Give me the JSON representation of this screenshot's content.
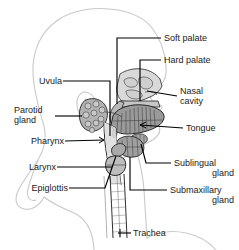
{
  "figure": {
    "background_color": "#ffffff",
    "label_color": "#1a1a1a",
    "leader_color": "#000000",
    "silhouette_color": "#cfcfcf",
    "organ_fill_light": "#d8d8d8",
    "organ_fill_mid": "#b8b8b8",
    "organ_fill_dark": "#8f8f8f"
  },
  "labels": {
    "soft_palate": "Soft palate",
    "hard_palate": "Hard palate",
    "nasal_cavity_line1": "Nasal",
    "nasal_cavity_line2": "cavity",
    "tongue": "Tongue",
    "sublingual_line1": "Sublingual",
    "sublingual_line2": "gland",
    "submaxillary_line1": "Submaxillary",
    "submaxillary_line2": "gland",
    "uvula": "Uvula",
    "parotid_line1": "Parotid",
    "parotid_line2": "gland",
    "pharynx": "Pharynx",
    "larynx": "Larynx",
    "epiglottis": "Epiglottis",
    "trachea": "Trachea"
  }
}
